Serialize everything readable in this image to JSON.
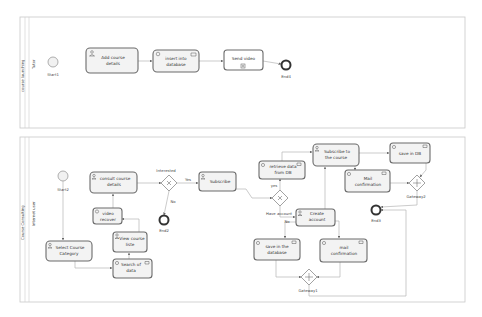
{
  "pools": [
    {
      "id": "pool-top",
      "name": "course launching",
      "lane": "Tutor"
    },
    {
      "id": "pool-bottom",
      "name": "Course Consulting",
      "lane": "Internet user"
    }
  ],
  "nodes": {
    "start1": "Start1",
    "add_course": [
      "Add course",
      "details"
    ],
    "insert_db": [
      "insert into",
      "database"
    ],
    "send_video": "Send video",
    "end4": "End4",
    "start2": "Start2",
    "select_category": [
      "Select Course",
      "Category"
    ],
    "consult_details": [
      "consult course",
      "details"
    ],
    "video_recover": [
      "video",
      "recover"
    ],
    "view_list": [
      "View course",
      "liste"
    ],
    "search_data": [
      "Search of",
      "data"
    ],
    "gw_interested": "Interested",
    "yes1": "Yes",
    "no1": "No",
    "end2": "End2",
    "subscribe": "Subscribe",
    "retrieve_db": [
      "retrieve data",
      "from DB"
    ],
    "subscribe_course": [
      "Subscribe to",
      "the course"
    ],
    "gw_have_account": "Have account",
    "yes2": "yes",
    "no2": "No",
    "create_account": [
      "Create",
      "account"
    ],
    "save_database": [
      "save in the",
      "database"
    ],
    "mail_confirm_lower": [
      "mail",
      "confirmation"
    ],
    "gateway1": "Gateway1",
    "save_db": "save in DB",
    "mail_confirm_upper": [
      "Mail",
      "confirmation"
    ],
    "gateway2": "Gateway2",
    "end3": "End3"
  },
  "colors": {
    "task_fill": "#f3f3f3",
    "task_stroke": "#6b6b6b",
    "flow": "#b5b5b5",
    "pool_border": "#c9c9c9"
  }
}
